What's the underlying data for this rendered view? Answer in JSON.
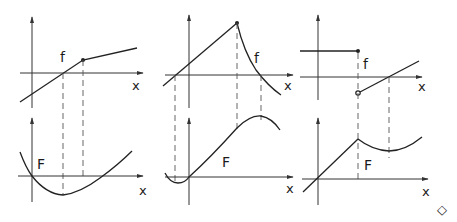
{
  "diagram": {
    "panels": [
      {
        "id": "left",
        "top": {
          "function_label": "f",
          "axis_label": "x"
        },
        "bottom": {
          "function_label": "F",
          "axis_label": "x"
        }
      },
      {
        "id": "middle",
        "top": {
          "function_label": "f",
          "axis_label": "x"
        },
        "bottom": {
          "function_label": "F",
          "axis_label": "x"
        }
      },
      {
        "id": "right",
        "top": {
          "function_label": "f",
          "axis_label": "x"
        },
        "bottom": {
          "function_label": "F",
          "axis_label": "x"
        }
      }
    ],
    "end_mark": "◇"
  }
}
